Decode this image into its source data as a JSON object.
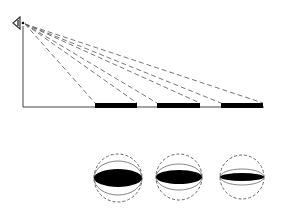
{
  "diagram": {
    "eye": {
      "x": 23,
      "y": 23,
      "icon": "eye-icon"
    },
    "axis": {
      "x": 23,
      "top": 26,
      "baseline_y": 107,
      "right": 264
    },
    "bars": [
      {
        "x1": 95,
        "x2": 137
      },
      {
        "x1": 157,
        "x2": 200
      },
      {
        "x1": 221,
        "x2": 263
      }
    ],
    "bar_top_y": 103,
    "circles": [
      {
        "cx": 118,
        "cy": 178,
        "r": 24,
        "ellipse_ry": 9,
        "outer_ry": 17
      },
      {
        "cx": 179,
        "cy": 177,
        "r": 23,
        "ellipse_ry": 7,
        "outer_ry": 13
      },
      {
        "cx": 242,
        "cy": 177,
        "r": 22,
        "ellipse_ry": 4,
        "outer_ry": 8
      }
    ],
    "colors": {
      "stroke": "#444444",
      "fill": "#000000",
      "dash": "#666666"
    }
  }
}
